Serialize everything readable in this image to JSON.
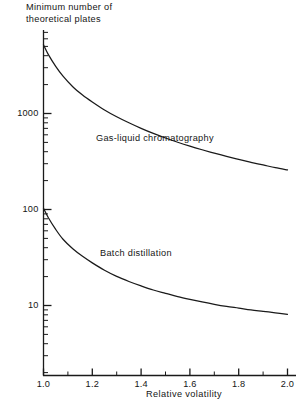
{
  "chart_data": {
    "type": "line",
    "title": "Minimum number of theoretical plates",
    "title_lines": [
      "Minimum  number  of",
      "theoretical  plates"
    ],
    "xlabel": "Relative volatility",
    "ylabel": "Minimum number of theoretical plates",
    "xscale": "linear",
    "yscale": "log",
    "xlim": [
      1.0,
      2.0
    ],
    "ylim": [
      3,
      9000
    ],
    "grid": false,
    "legend": "inline-annotations",
    "xticks": [
      1.0,
      1.2,
      1.4,
      1.6,
      1.8,
      2.0
    ],
    "xticklabels": [
      "1.0",
      "1.2",
      "1.4",
      "1.6",
      "1.8",
      "2.0"
    ],
    "xminorticks": [
      1.1,
      1.3,
      1.5,
      1.7,
      1.9
    ],
    "yticks": [
      10,
      100,
      1000
    ],
    "yticklabels": [
      "10",
      "100",
      "1000"
    ],
    "series": [
      {
        "name": "Gas-liquid chromatography",
        "label_position": "upper-middle",
        "x": [
          1.0,
          1.02,
          1.05,
          1.08,
          1.12,
          1.16,
          1.2,
          1.25,
          1.3,
          1.35,
          1.4,
          1.45,
          1.5,
          1.55,
          1.6,
          1.65,
          1.7,
          1.75,
          1.8,
          1.85,
          1.9,
          1.95,
          2.0
        ],
        "values": [
          5200,
          4100,
          3100,
          2450,
          1900,
          1560,
          1320,
          1090,
          925,
          800,
          700,
          620,
          556,
          502,
          457,
          419,
          386,
          357,
          332,
          310,
          291,
          273,
          258
        ]
      },
      {
        "name": "Batch distillation",
        "label_position": "lower-middle",
        "x": [
          1.0,
          1.02,
          1.05,
          1.08,
          1.12,
          1.16,
          1.2,
          1.25,
          1.3,
          1.35,
          1.4,
          1.45,
          1.5,
          1.55,
          1.6,
          1.65,
          1.7,
          1.75,
          1.8,
          1.85,
          1.9,
          1.95,
          2.0
        ],
        "values": [
          103,
          82,
          62,
          49,
          39,
          32.5,
          27.8,
          23.3,
          20.1,
          17.8,
          16.0,
          14.5,
          13.4,
          12.4,
          11.6,
          10.9,
          10.3,
          9.8,
          9.4,
          9.0,
          8.7,
          8.4,
          8.1
        ]
      }
    ],
    "annotations": [
      {
        "text": "Gas-liquid chromatography",
        "series": "Gas-liquid chromatography"
      },
      {
        "text": "Batch distillation",
        "series": "Batch distillation"
      }
    ],
    "colors": {
      "curve": "#1a1a1a",
      "axis": "#1a1a1a",
      "background": "#ffffff"
    }
  },
  "axis_caption": "Relative volatility",
  "curve_labels": {
    "upper": "Gas-liquid chromatography",
    "lower": "Batch distillation"
  }
}
